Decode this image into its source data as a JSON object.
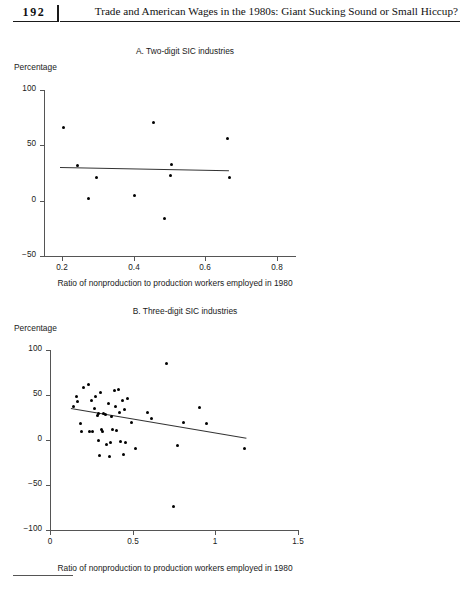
{
  "page": {
    "folio": "192",
    "running_head": "Trade and American Wages in the 1980s: Giant Sucking Sound or Small Hiccup?"
  },
  "chart_data": [
    {
      "id": "panel-a",
      "type": "scatter",
      "title": "A. Two-digit SIC industries",
      "ylabel": "Percentage",
      "xlabel": "Ratio of nonproduction to production workers employed in 1980",
      "xlim": [
        0.15,
        0.85
      ],
      "ylim": [
        -50,
        100
      ],
      "xticks": [
        0.2,
        0.4,
        0.6,
        0.8
      ],
      "xticklabels": [
        "0.2",
        "0.4",
        "0.6",
        "0.8"
      ],
      "yticks": [
        -50,
        0,
        50,
        100
      ],
      "yticklabels": [
        "-50",
        "0",
        "50",
        "100"
      ],
      "grid": false,
      "legend": null,
      "points": [
        {
          "x": 0.205,
          "y": 66
        },
        {
          "x": 0.243,
          "y": 32
        },
        {
          "x": 0.273,
          "y": 2
        },
        {
          "x": 0.297,
          "y": 21
        },
        {
          "x": 0.403,
          "y": 5
        },
        {
          "x": 0.455,
          "y": 71
        },
        {
          "x": 0.487,
          "y": -16
        },
        {
          "x": 0.506,
          "y": 33
        },
        {
          "x": 0.503,
          "y": 23
        },
        {
          "x": 0.663,
          "y": 56
        },
        {
          "x": 0.668,
          "y": 21
        }
      ],
      "fit_line": {
        "x0": 0.195,
        "y0": 30,
        "x1": 0.665,
        "y1": 27
      }
    },
    {
      "id": "panel-b",
      "type": "scatter",
      "title": "B. Three-digit SIC industries",
      "ylabel": "Percentage",
      "xlabel": "Ratio of nonproduction to production workers employed in 1980",
      "xlim": [
        0.0,
        1.5
      ],
      "ylim": [
        -100,
        100
      ],
      "xticks": [
        0,
        0.5,
        1,
        1.5
      ],
      "xticklabels": [
        "0",
        "0.5",
        "1",
        "1.5"
      ],
      "yticks": [
        -100,
        -50,
        0,
        50,
        100
      ],
      "yticklabels": [
        "-100",
        "-50",
        "0",
        "50",
        "100"
      ],
      "grid": false,
      "legend": null,
      "points": [
        {
          "x": 0.145,
          "y": 37
        },
        {
          "x": 0.158,
          "y": 48
        },
        {
          "x": 0.168,
          "y": 43
        },
        {
          "x": 0.182,
          "y": 18
        },
        {
          "x": 0.192,
          "y": 10
        },
        {
          "x": 0.205,
          "y": 58
        },
        {
          "x": 0.232,
          "y": 62
        },
        {
          "x": 0.238,
          "y": 10
        },
        {
          "x": 0.252,
          "y": 44
        },
        {
          "x": 0.258,
          "y": 9
        },
        {
          "x": 0.268,
          "y": 35
        },
        {
          "x": 0.278,
          "y": 48
        },
        {
          "x": 0.286,
          "y": 27
        },
        {
          "x": 0.292,
          "y": 29
        },
        {
          "x": 0.296,
          "y": -1
        },
        {
          "x": 0.302,
          "y": -17
        },
        {
          "x": 0.305,
          "y": 53
        },
        {
          "x": 0.312,
          "y": 12
        },
        {
          "x": 0.318,
          "y": 9
        },
        {
          "x": 0.326,
          "y": 30
        },
        {
          "x": 0.334,
          "y": 28
        },
        {
          "x": 0.341,
          "y": -5
        },
        {
          "x": 0.352,
          "y": 41
        },
        {
          "x": 0.358,
          "y": -18
        },
        {
          "x": 0.366,
          "y": -3
        },
        {
          "x": 0.373,
          "y": 26
        },
        {
          "x": 0.381,
          "y": 12
        },
        {
          "x": 0.392,
          "y": 55
        },
        {
          "x": 0.398,
          "y": 37
        },
        {
          "x": 0.404,
          "y": 11
        },
        {
          "x": 0.412,
          "y": 56
        },
        {
          "x": 0.418,
          "y": 31
        },
        {
          "x": 0.424,
          "y": -2
        },
        {
          "x": 0.438,
          "y": 44
        },
        {
          "x": 0.444,
          "y": -16
        },
        {
          "x": 0.452,
          "y": 34
        },
        {
          "x": 0.458,
          "y": -3
        },
        {
          "x": 0.468,
          "y": 46
        },
        {
          "x": 0.492,
          "y": 20
        },
        {
          "x": 0.515,
          "y": -9
        },
        {
          "x": 0.588,
          "y": 31
        },
        {
          "x": 0.612,
          "y": 24
        },
        {
          "x": 0.702,
          "y": 85
        },
        {
          "x": 0.745,
          "y": -74
        },
        {
          "x": 0.772,
          "y": -6
        },
        {
          "x": 0.808,
          "y": 20
        },
        {
          "x": 0.902,
          "y": 36
        },
        {
          "x": 0.948,
          "y": 18
        },
        {
          "x": 1.178,
          "y": -9
        }
      ],
      "fit_line": {
        "x0": 0.125,
        "y0": 36,
        "x1": 1.188,
        "y1": 3
      }
    }
  ]
}
